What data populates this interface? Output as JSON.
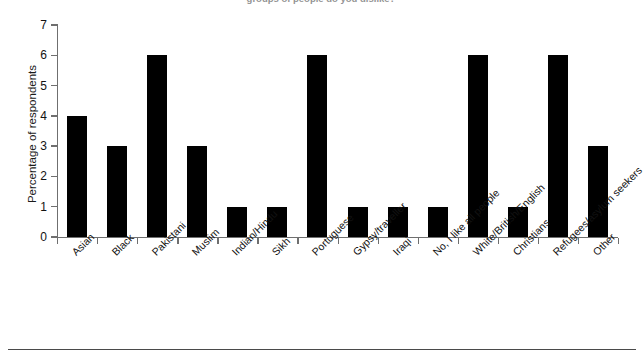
{
  "top_caption": "groups of people do you dislike?",
  "footer_caption": "",
  "chart_data": {
    "type": "bar",
    "title": "",
    "xlabel": "",
    "ylabel": "Percentage of respondents",
    "ylim": [
      0,
      7
    ],
    "yticks": [
      0,
      1,
      2,
      3,
      4,
      5,
      6,
      7
    ],
    "grid": false,
    "legend": null,
    "bar_color": "#000000",
    "axis_color": "#6f6f6f",
    "categories": [
      "Asian",
      "Black",
      "Pakistani",
      "Muslim",
      "Indian/Hindu",
      "Sikh",
      "Portuguese",
      "Gypsy/traveller",
      "Iraqi",
      "No, I like all people",
      "White/British/English",
      "Christians",
      "Refugees/asylum seekers",
      "Other"
    ],
    "values": [
      4,
      3,
      6,
      3,
      1,
      1,
      6,
      1,
      1,
      1,
      6,
      1,
      6,
      3
    ]
  }
}
